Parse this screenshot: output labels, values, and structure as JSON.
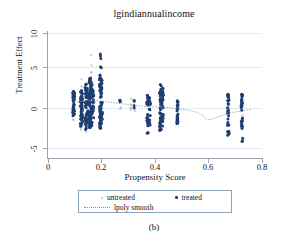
{
  "figure": {
    "caption": "(b)",
    "title": "lgindiannualincome"
  },
  "chart_data": {
    "type": "scatter",
    "title": "lgindiannualincome",
    "xlabel": "Propensity Score",
    "ylabel": "Treatment Effect",
    "xlim": [
      0,
      0.85
    ],
    "ylim": [
      -6.2,
      10.6
    ],
    "xticks": [
      0,
      0.2,
      0.4,
      0.6,
      0.8
    ],
    "xtick_labels": [
      "0",
      "0.2",
      "0.4",
      "0.6",
      "0.8"
    ],
    "yticks": [
      -5,
      0,
      5,
      10
    ],
    "ytick_labels": [
      "-5",
      "0",
      "5",
      "10"
    ],
    "grid": true,
    "legend_position": "below-axis",
    "legend": [
      {
        "label": "untreated",
        "marker": "dot",
        "color": "#b9c4cf"
      },
      {
        "label": "treated",
        "marker": "dot",
        "color": "#1f3f73"
      },
      {
        "label": "lpoly smooth",
        "marker": "dotted-line",
        "color": "#8a9098"
      }
    ],
    "colors": {
      "treated": "#1f3f73",
      "untreated": "#b9c4cf",
      "smooth": "#8a9098",
      "axis": "#9aa3ad",
      "grid": "#e3ecf3"
    },
    "series": [
      {
        "name": "treated",
        "color": "#1f3f73",
        "marker_size": 1.5,
        "clusters": [
          {
            "x": 0.1,
            "n": 26,
            "y_center": 1.4,
            "y_min": -0.6,
            "y_max": 3.0,
            "spread": 0.25
          },
          {
            "x": 0.104,
            "n": 14,
            "y_center": 1.2,
            "y_min": -0.4,
            "y_max": 2.6,
            "spread": 0.2
          },
          {
            "x": 0.131,
            "n": 30,
            "y_center": 0.6,
            "y_min": -2.1,
            "y_max": 2.9,
            "spread": 0.3
          },
          {
            "x": 0.136,
            "n": 22,
            "y_center": 0.7,
            "y_min": -1.8,
            "y_max": 2.6,
            "spread": 0.25
          },
          {
            "x": 0.15,
            "n": 34,
            "y_center": 0.9,
            "y_min": -2.4,
            "y_max": 4.1,
            "spread": 0.3
          },
          {
            "x": 0.156,
            "n": 20,
            "y_center": 1.0,
            "y_min": -1.6,
            "y_max": 3.3,
            "spread": 0.25
          },
          {
            "x": 0.166,
            "n": 46,
            "y_center": 1.5,
            "y_min": -2.2,
            "y_max": 4.6,
            "spread": 0.35
          },
          {
            "x": 0.172,
            "n": 38,
            "y_center": 1.6,
            "y_min": -1.9,
            "y_max": 4.2,
            "spread": 0.3
          },
          {
            "x": 0.179,
            "n": 24,
            "y_center": 1.3,
            "y_min": -1.2,
            "y_max": 3.1,
            "spread": 0.25
          },
          {
            "x": 0.208,
            "n": 52,
            "y_center": 1.3,
            "y_min": -2.4,
            "y_max": 5.1,
            "spread": 0.35
          },
          {
            "x": 0.213,
            "n": 30,
            "y_center": 1.5,
            "y_min": -1.6,
            "y_max": 4.4,
            "spread": 0.3
          },
          {
            "x": 0.21,
            "n": 5,
            "y_center": 7.0,
            "y_min": 5.8,
            "y_max": 7.8,
            "spread": 0.2
          },
          {
            "x": 0.286,
            "n": 3,
            "y_center": 1.6,
            "y_min": 1.3,
            "y_max": 1.9,
            "spread": 0.15
          },
          {
            "x": 0.342,
            "n": 4,
            "y_center": 0.9,
            "y_min": 0.3,
            "y_max": 1.6,
            "spread": 0.2
          },
          {
            "x": 0.395,
            "n": 28,
            "y_center": 0.4,
            "y_min": -3.0,
            "y_max": 2.4,
            "spread": 0.3
          },
          {
            "x": 0.404,
            "n": 16,
            "y_center": 0.6,
            "y_min": -2.2,
            "y_max": 2.1,
            "spread": 0.25
          },
          {
            "x": 0.447,
            "n": 44,
            "y_center": 0.6,
            "y_min": -2.5,
            "y_max": 3.7,
            "spread": 0.35
          },
          {
            "x": 0.455,
            "n": 30,
            "y_center": 0.7,
            "y_min": -1.9,
            "y_max": 3.2,
            "spread": 0.3
          },
          {
            "x": 0.514,
            "n": 22,
            "y_center": 0.1,
            "y_min": -1.6,
            "y_max": 1.7,
            "spread": 0.25
          },
          {
            "x": 0.716,
            "n": 30,
            "y_center": 0.1,
            "y_min": -3.2,
            "y_max": 2.6,
            "spread": 0.3
          },
          {
            "x": 0.77,
            "n": 30,
            "y_center": 0.2,
            "y_min": -2.3,
            "y_max": 2.4,
            "spread": 0.3
          },
          {
            "x": 0.772,
            "n": 3,
            "y_center": -3.8,
            "y_min": -4.0,
            "y_max": -3.5,
            "spread": 0.15
          }
        ]
      },
      {
        "name": "untreated",
        "color": "#b9c4cf",
        "marker_size": 1.1,
        "clusters": [
          {
            "x": 0.1,
            "n": 10,
            "y_center": 1.0,
            "y_min": -1.4,
            "y_max": 2.6,
            "spread": 0.3
          },
          {
            "x": 0.133,
            "n": 14,
            "y_center": 0.9,
            "y_min": -2.8,
            "y_max": 4.5,
            "spread": 0.35
          },
          {
            "x": 0.152,
            "n": 12,
            "y_center": 0.8,
            "y_min": -3.4,
            "y_max": 4.0,
            "spread": 0.35
          },
          {
            "x": 0.168,
            "n": 10,
            "y_center": 1.2,
            "y_min": -2.4,
            "y_max": 3.4,
            "spread": 0.3
          },
          {
            "x": 0.172,
            "n": 5,
            "y_center": 6.0,
            "y_min": 5.2,
            "y_max": 8.1,
            "spread": 0.25
          },
          {
            "x": 0.209,
            "n": 12,
            "y_center": 1.1,
            "y_min": -4.0,
            "y_max": 4.6,
            "spread": 0.4
          },
          {
            "x": 0.288,
            "n": 4,
            "y_center": 1.0,
            "y_min": 0.2,
            "y_max": 1.8,
            "spread": 0.25
          },
          {
            "x": 0.33,
            "n": 5,
            "y_center": 1.2,
            "y_min": 0.2,
            "y_max": 2.6,
            "spread": 0.3
          },
          {
            "x": 0.344,
            "n": 4,
            "y_center": 0.6,
            "y_min": 0.0,
            "y_max": 1.3,
            "spread": 0.2
          },
          {
            "x": 0.397,
            "n": 8,
            "y_center": 0.5,
            "y_min": -2.0,
            "y_max": 2.2,
            "spread": 0.3
          },
          {
            "x": 0.45,
            "n": 8,
            "y_center": 0.5,
            "y_min": -2.1,
            "y_max": 2.6,
            "spread": 0.3
          },
          {
            "x": 0.516,
            "n": 6,
            "y_center": 0.2,
            "y_min": -1.2,
            "y_max": 1.4,
            "spread": 0.25
          },
          {
            "x": 0.718,
            "n": 8,
            "y_center": 0.3,
            "y_min": -2.0,
            "y_max": 2.4,
            "spread": 0.3
          },
          {
            "x": 0.772,
            "n": 8,
            "y_center": 0.2,
            "y_min": -2.0,
            "y_max": 2.2,
            "spread": 0.3
          }
        ]
      }
    ],
    "smooth_curve": {
      "name": "lpoly smooth",
      "color": "#8a9098",
      "style": "dotted",
      "points": [
        [
          0.095,
          1.15
        ],
        [
          0.115,
          1.35
        ],
        [
          0.135,
          1.45
        ],
        [
          0.155,
          1.5
        ],
        [
          0.175,
          1.52
        ],
        [
          0.195,
          1.5
        ],
        [
          0.215,
          1.45
        ],
        [
          0.24,
          1.32
        ],
        [
          0.265,
          1.2
        ],
        [
          0.29,
          1.1
        ],
        [
          0.315,
          1.0
        ],
        [
          0.34,
          0.88
        ],
        [
          0.365,
          0.78
        ],
        [
          0.39,
          0.72
        ],
        [
          0.415,
          0.7
        ],
        [
          0.44,
          0.68
        ],
        [
          0.465,
          0.62
        ],
        [
          0.49,
          0.52
        ],
        [
          0.515,
          0.42
        ],
        [
          0.54,
          0.3
        ],
        [
          0.565,
          0.15
        ],
        [
          0.59,
          -0.05
        ],
        [
          0.615,
          -0.45
        ],
        [
          0.628,
          -0.95
        ],
        [
          0.645,
          -1.05
        ],
        [
          0.665,
          -0.8
        ],
        [
          0.69,
          -0.5
        ],
        [
          0.715,
          -0.25
        ],
        [
          0.74,
          -0.05
        ],
        [
          0.765,
          0.1
        ],
        [
          0.79,
          0.22
        ],
        [
          0.805,
          0.28
        ]
      ]
    }
  }
}
